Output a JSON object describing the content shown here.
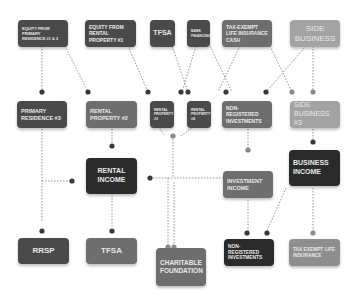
{
  "diagram": {
    "sources": [
      {
        "id": "equity-primary",
        "label": "EQUITY FROM PRIMARY RESIDENCE #1 & 2"
      },
      {
        "id": "equity-rental",
        "label": "EQUITY FROM RENTAL PROPERTY #1"
      },
      {
        "id": "tfsa-top",
        "label": "TFSA"
      },
      {
        "id": "bank-financing",
        "label": "BANK FINANCING"
      },
      {
        "id": "life-insurance-cash",
        "label": "TAX-EXEMPT LIFE INSURANCE CASH"
      },
      {
        "id": "side-business",
        "label": "SIDE BUSINESS"
      }
    ],
    "assets": [
      {
        "id": "primary-residence-3",
        "label": "PRIMARY RESIDENCE #3"
      },
      {
        "id": "rental-property-2",
        "label": "RENTAL PROPERTY #2"
      },
      {
        "id": "rental-property-3",
        "label": "RENTAL PROPERTY #3"
      },
      {
        "id": "rental-property-4",
        "label": "RENTAL PROPERTY #4"
      },
      {
        "id": "non-registered-investments-mid",
        "label": "NON-REGISTERED INVESTMENTS"
      },
      {
        "id": "side-business-3",
        "label": "SIDE BUSINESS #3"
      }
    ],
    "income": [
      {
        "id": "rental-income",
        "label": "RENTAL INCOME"
      },
      {
        "id": "investment-income",
        "label": "INVESTMENT INCOME"
      },
      {
        "id": "business-income",
        "label": "BUSINESS INCOME"
      }
    ],
    "destinations": [
      {
        "id": "rrsp",
        "label": "RRSP"
      },
      {
        "id": "tfsa-bottom",
        "label": "TFSA"
      },
      {
        "id": "charitable-foundation",
        "label": "CHARITABLE FOUNDATION"
      },
      {
        "id": "non-registered-investments-bottom",
        "label": "NON-REGISTERED INVESTMENTS"
      },
      {
        "id": "tax-exempt-life-insurance",
        "label": "TAX EXEMPT LIFE INSURANCE"
      }
    ],
    "colors": {
      "dark": "#2b2b2b",
      "mid": "#4a4a4a",
      "grey": "#6e6e6e",
      "light": "#8e8e8e",
      "lighter": "#a3a3a3",
      "connector": "#555555"
    }
  }
}
